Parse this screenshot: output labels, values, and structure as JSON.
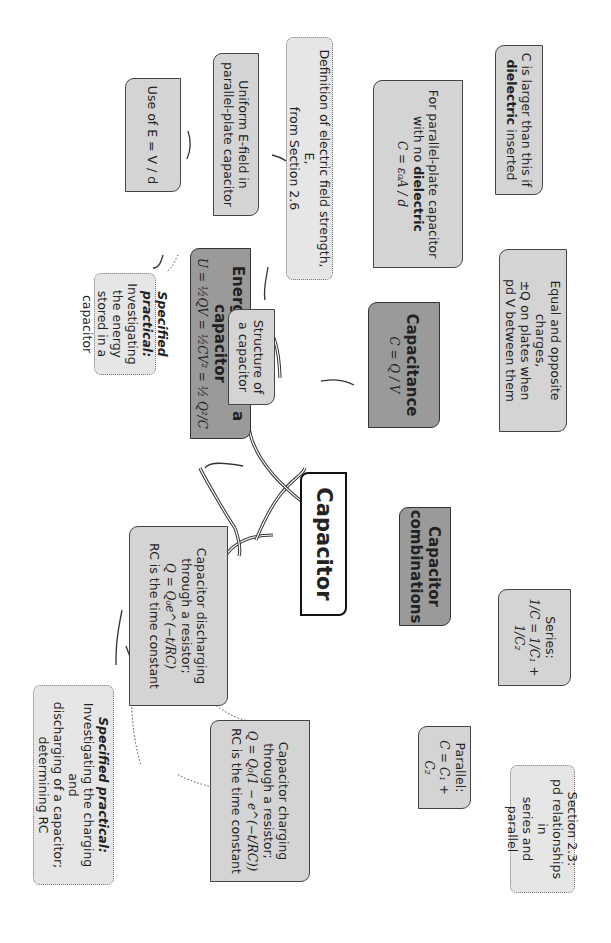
{
  "diagram": {
    "title": "Capacitor",
    "orientation": "rotated 90 degrees clockwise",
    "colors": {
      "central_fill": "#ffffff",
      "main_topic_fill": "#9a9a9a",
      "subtopic_fill": "#d2d2d2",
      "reference_fill": "#e6e6e6",
      "line": "#333333"
    },
    "nodes": {
      "center": {
        "label": "Capacitor"
      },
      "capacitance": {
        "title": "Capacitance",
        "formula": "C = Q / V"
      },
      "equal_charges": {
        "line1": "Equal and opposite charges,",
        "line2": "±Q on plates when",
        "line3": "pd V between them"
      },
      "parallel_plate": {
        "line1": "For parallel-plate capacitor",
        "line2_pre": "with no ",
        "line2_bold": "dielectric",
        "formula": "C = ε₀A / d"
      },
      "dielectric": {
        "line1": "C is larger than this if",
        "line2_bold": "dielectric",
        "line2_post": " inserted"
      },
      "field_definition": {
        "line1": "Definition of electric field strength, E,",
        "line2": "from Section 2.6"
      },
      "uniform_field": {
        "line1": "Uniform E-field in",
        "line2": "parallel-plate capacitor"
      },
      "use_of_e": {
        "label": "Use of E = V / d"
      },
      "structure": {
        "line1": "Structure of",
        "line2": "a capacitor"
      },
      "energy": {
        "title": "Energy stored in a capacitor",
        "formula": "U = ½QV = ½CV² = ½ Q²/C"
      },
      "energy_practical": {
        "title": "Specified practical:",
        "line1": "Investigating the energy",
        "line2": "stored in a capacitor"
      },
      "combinations": {
        "line1": "Capacitor",
        "line2": "combinations"
      },
      "series": {
        "label": "Series:",
        "formula": "1/C = 1/C₁ + 1/C₂"
      },
      "parallel": {
        "label": "Parallel:",
        "formula": "C = C₁ + C₂"
      },
      "section_23": {
        "line1": "Section 2.3:",
        "line2": "pd relationships in",
        "line3": "series and parallel"
      },
      "discharging": {
        "line1": "Capacitor discharging",
        "line2": "through a resistor;",
        "formula": "Q = Q₀e^(−t/RC)",
        "line3": "RC is the time constant"
      },
      "charging": {
        "line1": "Capacitor charging",
        "line2": "through a resistor;",
        "formula": "Q = Q₀(1 − e^(−t/RC))",
        "line3": "RC is the time constant"
      },
      "rc_practical": {
        "title": "Specified practical:",
        "line1": "Investigating the charging and",
        "line2": "discharging of a capacitor;",
        "line3": "determining RC"
      }
    }
  }
}
